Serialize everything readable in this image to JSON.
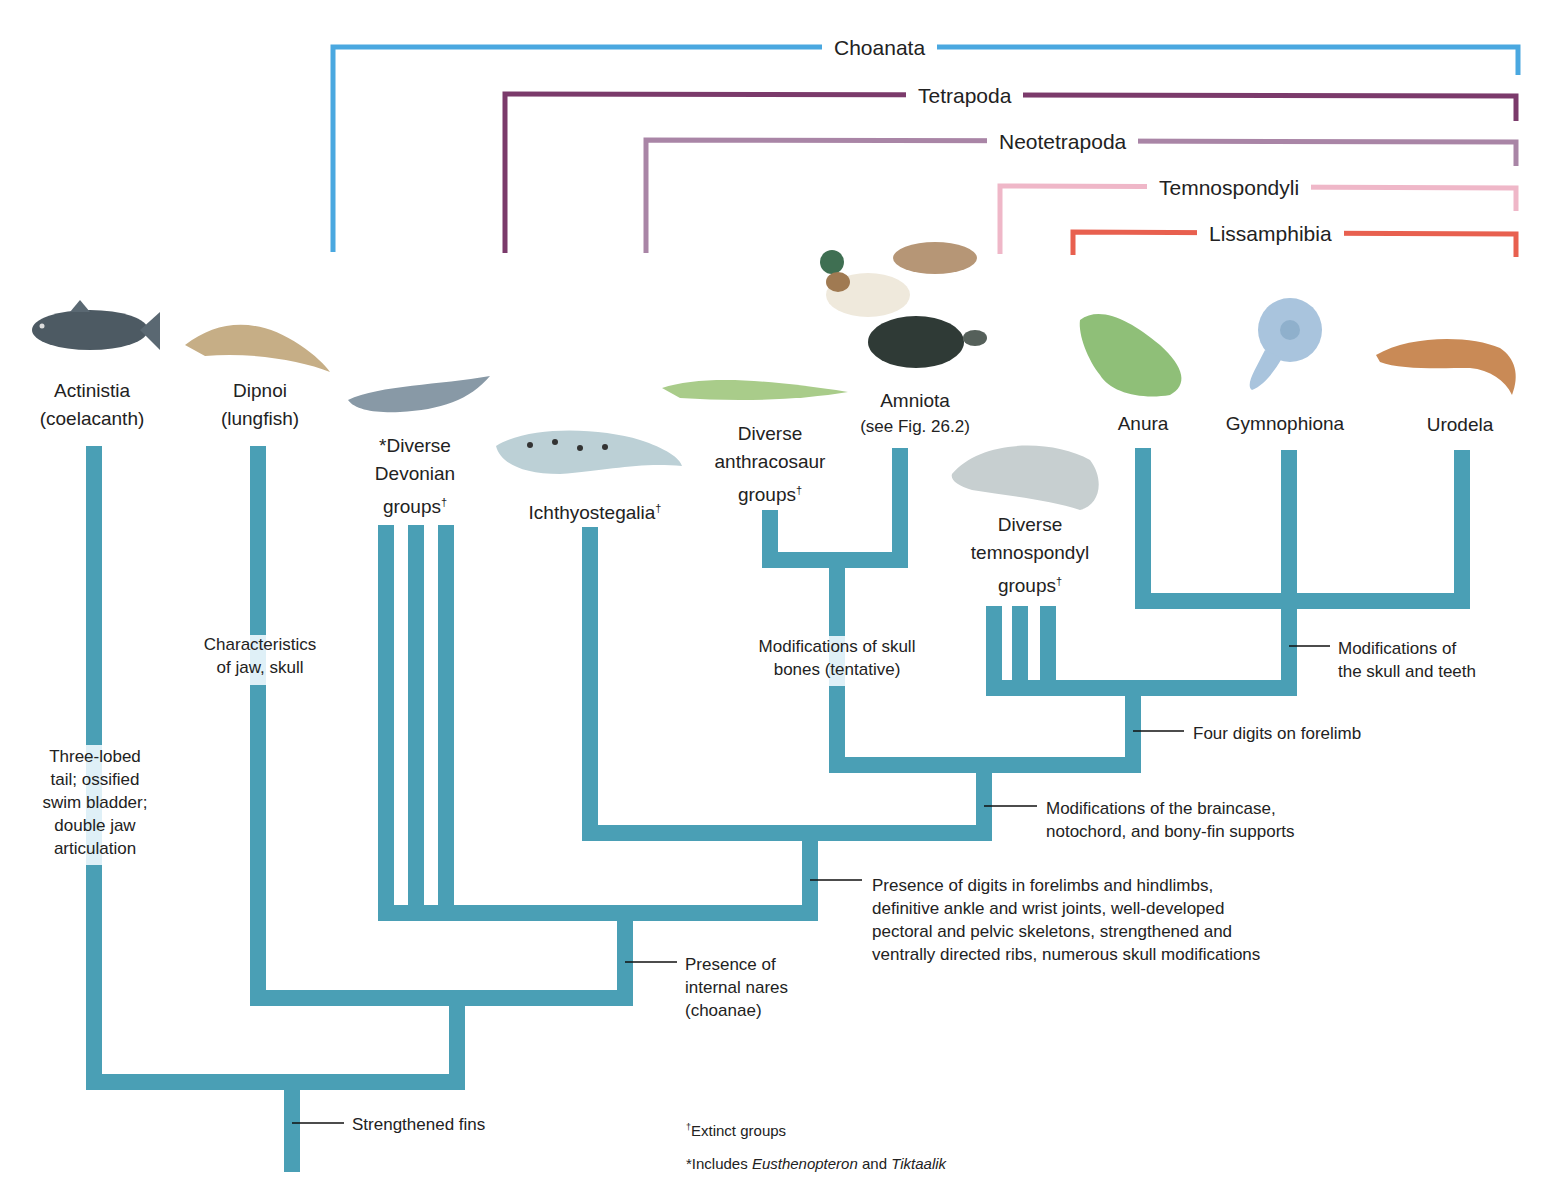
{
  "figure": {
    "type": "cladogram",
    "branch_color": "#4a9fb5",
    "clade_brackets": [
      {
        "name": "Choanata",
        "color": "#4aa8e0"
      },
      {
        "name": "Tetrapoda",
        "color": "#7b3a6b"
      },
      {
        "name": "Neotetrapoda",
        "color": "#a985a6"
      },
      {
        "name": "Temnospondyli",
        "color": "#efb7c8"
      },
      {
        "name": "Lissamphibia",
        "color": "#e8604f"
      }
    ],
    "taxa": [
      {
        "name": "Actinistia",
        "sub": "(coelacanth)",
        "extinct": false
      },
      {
        "name": "Dipnoi",
        "sub": "(lungfish)",
        "extinct": false
      },
      {
        "name": "*Diverse Devonian groups",
        "lines": [
          "*Diverse",
          "Devonian",
          "groups"
        ],
        "extinct": true
      },
      {
        "name": "Ichthyostegalia",
        "extinct": true
      },
      {
        "name": "Diverse anthracosaur groups",
        "lines": [
          "Diverse",
          "anthracosaur",
          "groups"
        ],
        "extinct": true
      },
      {
        "name": "Amniota",
        "sub": "(see Fig. 26.2)",
        "extinct": false
      },
      {
        "name": "Diverse temnospondyl groups",
        "lines": [
          "Diverse",
          "temnospondyl",
          "groups"
        ],
        "extinct": true
      },
      {
        "name": "Anura",
        "extinct": false
      },
      {
        "name": "Gymnophiona",
        "extinct": false
      },
      {
        "name": "Urodela",
        "extinct": false
      }
    ],
    "characters": {
      "strengthened_fins": "Strengthened fins",
      "actinistia": [
        "Three-lobed",
        "tail; ossified",
        "swim bladder;",
        "double jaw",
        "articulation"
      ],
      "dipnoi": [
        "Characteristics",
        "of jaw, skull"
      ],
      "choanae": [
        "Presence of",
        "internal nares",
        "(choanae)"
      ],
      "tetrapoda": [
        "Presence of digits in forelimbs and hindlimbs,",
        "definitive ankle and wrist joints, well-developed",
        "pectoral and pelvic skeletons, strengthened and",
        "ventrally directed ribs, numerous skull modifications"
      ],
      "neotetrapoda": [
        "Modifications of the braincase,",
        "notochord, and bony-fin supports"
      ],
      "anthracosaur_amniota": [
        "Modifications of skull",
        "bones (tentative)"
      ],
      "temnospondyli": "Four digits on forelimb",
      "lissamphibia": [
        "Modifications of",
        "the skull and teeth"
      ]
    },
    "notes": {
      "extinct": "Extinct groups",
      "dagger": "†",
      "includes_prefix": "*Includes ",
      "genus1": "Eusthenopteron",
      "and": " and ",
      "genus2": "Tiktaalik"
    },
    "animals": [
      "coelacanth",
      "lungfish",
      "devonian-fish",
      "ichthyostega",
      "anthracosaur",
      "duck",
      "mole",
      "turtle",
      "temnospondyl",
      "frog",
      "caecilian",
      "salamander"
    ]
  }
}
